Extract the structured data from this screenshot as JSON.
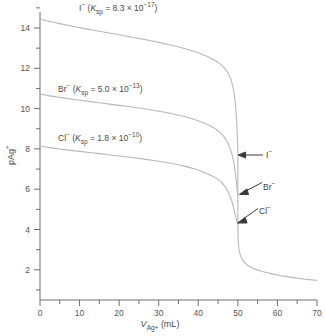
{
  "chart_data": {
    "type": "line",
    "title": "",
    "xlabel": "V(Ag+) (mL)",
    "ylabel": "pAg+",
    "xlim": [
      0,
      70
    ],
    "ylim": [
      1,
      15.4
    ],
    "grid": false,
    "legend_position": "inline-annotations",
    "x_ticks": [
      0,
      10,
      20,
      30,
      40,
      50,
      60,
      70
    ],
    "x_tick_labels": [
      "0",
      "10",
      "20",
      "30",
      "40",
      "50",
      "60",
      "70"
    ],
    "x_minor_ticks": [
      5,
      15,
      25,
      35,
      45,
      55,
      65
    ],
    "y_ticks": [
      2,
      4,
      6,
      8,
      10,
      12,
      14
    ],
    "y_tick_labels": [
      "2",
      "4",
      "6",
      "8",
      "10",
      "12",
      "14"
    ],
    "y_minor_ticks": [
      1,
      3,
      5,
      7,
      9,
      11,
      13,
      15
    ],
    "equivalence_volume": 50,
    "series": [
      {
        "name": "I-",
        "ksp": "8.3 x 10^-17",
        "color": "#b8b8b8",
        "break_pAg": 8.5,
        "points": [
          [
            0,
            15.05
          ],
          [
            2,
            14.95
          ],
          [
            5,
            14.82
          ],
          [
            10,
            14.62
          ],
          [
            15,
            14.44
          ],
          [
            20,
            14.26
          ],
          [
            25,
            14.08
          ],
          [
            30,
            13.88
          ],
          [
            33,
            13.75
          ],
          [
            36,
            13.6
          ],
          [
            39,
            13.42
          ],
          [
            42,
            13.2
          ],
          [
            44,
            13.0
          ],
          [
            45,
            12.88
          ],
          [
            46,
            12.72
          ],
          [
            47,
            12.5
          ],
          [
            48,
            12.15
          ],
          [
            48.5,
            11.85
          ],
          [
            49,
            11.4
          ],
          [
            49.3,
            10.95
          ],
          [
            49.5,
            10.5
          ],
          [
            49.7,
            9.9
          ],
          [
            49.85,
            9.25
          ],
          [
            49.95,
            8.8
          ],
          [
            50,
            8.5
          ]
        ]
      },
      {
        "name": "Br-",
        "ksp": "5.0 x 10^-13",
        "color": "#b8b8b8",
        "break_pAg": 6.2,
        "points": [
          [
            0,
            11.3
          ],
          [
            2,
            11.22
          ],
          [
            5,
            11.13
          ],
          [
            10,
            10.99
          ],
          [
            15,
            10.86
          ],
          [
            20,
            10.73
          ],
          [
            25,
            10.6
          ],
          [
            30,
            10.44
          ],
          [
            33,
            10.33
          ],
          [
            36,
            10.2
          ],
          [
            39,
            10.03
          ],
          [
            42,
            9.8
          ],
          [
            44,
            9.6
          ],
          [
            45,
            9.46
          ],
          [
            46,
            9.28
          ],
          [
            47,
            9.02
          ],
          [
            48,
            8.6
          ],
          [
            48.5,
            8.3
          ],
          [
            49,
            7.85
          ],
          [
            49.3,
            7.45
          ],
          [
            49.5,
            7.1
          ],
          [
            49.7,
            6.75
          ],
          [
            49.85,
            6.45
          ],
          [
            49.95,
            6.28
          ],
          [
            50,
            6.2
          ]
        ]
      },
      {
        "name": "Cl-",
        "ksp": "1.8 x 10^-10",
        "color": "#b8b8b8",
        "break_pAg": 4.8,
        "points": [
          [
            0,
            8.7
          ],
          [
            2,
            8.63
          ],
          [
            5,
            8.55
          ],
          [
            10,
            8.43
          ],
          [
            15,
            8.32
          ],
          [
            20,
            8.2
          ],
          [
            25,
            8.08
          ],
          [
            30,
            7.94
          ],
          [
            33,
            7.84
          ],
          [
            36,
            7.72
          ],
          [
            39,
            7.56
          ],
          [
            42,
            7.34
          ],
          [
            44,
            7.15
          ],
          [
            45,
            7.02
          ],
          [
            46,
            6.85
          ],
          [
            47,
            6.6
          ],
          [
            48,
            6.2
          ],
          [
            48.5,
            5.92
          ],
          [
            49,
            5.55
          ],
          [
            49.3,
            5.3
          ],
          [
            49.5,
            5.15
          ],
          [
            49.7,
            4.98
          ],
          [
            49.85,
            4.88
          ],
          [
            49.95,
            4.82
          ],
          [
            50,
            4.8
          ]
        ]
      },
      {
        "name": "excess-titrant-tail",
        "color": "#b8b8b8",
        "points": [
          [
            50,
            4.8
          ],
          [
            50.05,
            4.3
          ],
          [
            50.1,
            4.0
          ],
          [
            50.2,
            3.7
          ],
          [
            50.4,
            3.42
          ],
          [
            50.8,
            3.15
          ],
          [
            51.5,
            2.92
          ],
          [
            52.5,
            2.74
          ],
          [
            54,
            2.58
          ],
          [
            56,
            2.44
          ],
          [
            58,
            2.34
          ],
          [
            60,
            2.25
          ],
          [
            62,
            2.18
          ],
          [
            64,
            2.12
          ],
          [
            66,
            2.07
          ],
          [
            68,
            2.02
          ],
          [
            70,
            1.98
          ]
        ]
      }
    ],
    "annotations": [
      {
        "text": "I-",
        "at_pAg": 8.5,
        "arrow": "horizontal"
      },
      {
        "text": "Br-",
        "at_pAg": 6.2,
        "arrow": "diagonal"
      },
      {
        "text": "Cl-",
        "at_pAg": 4.8,
        "arrow": "diagonal"
      }
    ]
  },
  "labels": {
    "iodide_prefix": "I",
    "iodide_minus": "−",
    "iodide_body_open": " (",
    "ksp_K": "K",
    "ksp_sub": "sp",
    "ksp_eq": " = ",
    "iodide_mantissa": "8.3 × 10",
    "iodide_exp": "−17",
    "close_paren": ")",
    "bromide_prefix": "Br",
    "bromide_mantissa": "5.0 × 10",
    "bromide_exp": "−13",
    "chloride_prefix": "Cl",
    "chloride_mantissa": "1.8 × 10",
    "chloride_exp": "−10"
  },
  "annotation_labels": {
    "iodide": "I",
    "bromide": "Br",
    "chloride": "Cl",
    "minus": "−"
  },
  "axes": {
    "y_title_main": "pAg",
    "y_title_sup": "+",
    "x_title_V": "V",
    "x_title_sub": "Ag",
    "x_title_sub_plus": "+",
    "x_title_units": " (mL)",
    "y_tick_labels": [
      "14",
      "12",
      "10",
      "8",
      "6",
      "4",
      "2"
    ],
    "x_tick_labels": [
      "0",
      "10",
      "20",
      "30",
      "40",
      "50",
      "60",
      "70"
    ]
  },
  "colors": {
    "curve": "#b8b8b8",
    "axis": "#6e6e6e",
    "text": "#555555",
    "annotation": "#333333",
    "background": "#ffffff"
  }
}
